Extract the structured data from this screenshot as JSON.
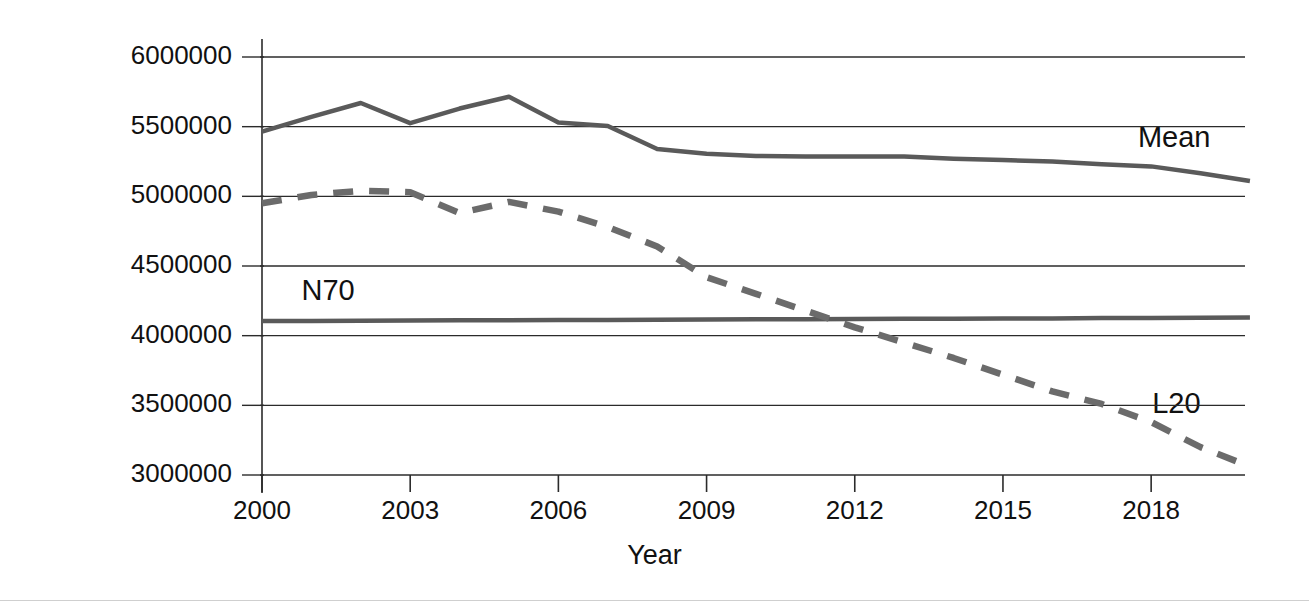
{
  "chart_data": {
    "type": "line",
    "title": "",
    "xlabel": "Year",
    "ylabel": "Population",
    "xlim": [
      2000,
      2020
    ],
    "ylim": [
      3000000,
      6000000
    ],
    "grid": true,
    "legend_position": "inline-right",
    "xticks": [
      "2000",
      "2003",
      "2006",
      "2009",
      "2012",
      "2015",
      "2018"
    ],
    "xtick_values": [
      2000,
      2003,
      2006,
      2009,
      2012,
      2015,
      2018
    ],
    "yticks": [
      "6000000",
      "5500000",
      "5000000",
      "4500000",
      "4000000",
      "3500000",
      "3000000"
    ],
    "ytick_values": [
      6000000,
      5500000,
      5000000,
      4500000,
      4000000,
      3500000,
      3000000
    ],
    "x": [
      2000,
      2001,
      2002,
      2003,
      2004,
      2005,
      2006,
      2007,
      2008,
      2009,
      2010,
      2011,
      2012,
      2013,
      2014,
      2015,
      2016,
      2017,
      2018,
      2019,
      2020
    ],
    "series": [
      {
        "name": "Mean",
        "style": "solid",
        "color": "#5a5a5a",
        "label": "Mean",
        "values": [
          5465000,
          5570000,
          5670000,
          5525000,
          5630000,
          5715000,
          5530000,
          5505000,
          5340000,
          5305000,
          5290000,
          5285000,
          5285000,
          5285000,
          5270000,
          5260000,
          5250000,
          5230000,
          5215000,
          5165000,
          5110000
        ]
      },
      {
        "name": "N70",
        "style": "solid",
        "color": "#5a5a5a",
        "label": "N70",
        "values": [
          4105000,
          4106000,
          4107000,
          4108000,
          4110000,
          4111000,
          4112000,
          4113000,
          4114000,
          4116000,
          4117000,
          4118000,
          4119000,
          4121000,
          4122000,
          4123000,
          4124000,
          4126000,
          4127000,
          4128000,
          4130000
        ]
      },
      {
        "name": "L20",
        "style": "dashed",
        "color": "#6b6b6b",
        "label": "L20",
        "values": [
          4950000,
          5010000,
          5040000,
          5030000,
          4880000,
          4960000,
          4890000,
          4780000,
          4640000,
          4420000,
          4300000,
          4180000,
          4060000,
          3950000,
          3840000,
          3720000,
          3600000,
          3510000,
          3380000,
          3200000,
          3060000
        ]
      }
    ],
    "annotations": [
      {
        "text": "Mean",
        "x": 2019.2,
        "y": 5400000
      },
      {
        "text": "N70",
        "x": 2000.8,
        "y": 4300000
      },
      {
        "text": "L20",
        "x": 2019.0,
        "y": 3490000
      }
    ]
  }
}
